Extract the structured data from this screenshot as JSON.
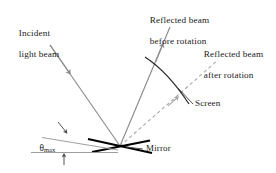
{
  "figure": {
    "type": "optics-ray-diagram",
    "background": "#ffffff",
    "colors": {
      "ray": "#8c8c8c",
      "mirror": "#000000",
      "arc": "#2b2b2b",
      "baseline": "#9a9a9a",
      "text": "#1a1a1a",
      "dashed_ray": "#a0a0a0"
    }
  },
  "labels": {
    "incident_line1": "Incident",
    "incident_line2": "light beam",
    "reflected_before_line1": "Reflected beam",
    "reflected_before_line2": "before rotation",
    "reflected_after_line1": "Reflected beam",
    "reflected_after_line2": "after rotation",
    "screen": "Screen",
    "mirror": "Mirror",
    "theta_symbol": "θ",
    "theta_subscript": "max"
  },
  "geometry": {
    "pivot": {
      "x": 120,
      "y": 146
    },
    "incident_beam": {
      "from": {
        "x": 50,
        "y": 45
      },
      "to": {
        "x": 120,
        "y": 146
      }
    },
    "reflected_before": {
      "from": {
        "x": 120,
        "y": 146
      },
      "to": {
        "x": 170,
        "y": 27
      }
    },
    "reflected_after": {
      "from": {
        "x": 120,
        "y": 146
      },
      "to": {
        "x": 218,
        "y": 60
      }
    },
    "mirror_line_a": {
      "from": {
        "x": 88,
        "y": 138
      },
      "to": {
        "x": 152,
        "y": 152
      }
    },
    "mirror_line_b": {
      "from": {
        "x": 92,
        "y": 151
      },
      "to": {
        "x": 150,
        "y": 140
      }
    },
    "screen_arc": {
      "start": {
        "x": 145,
        "y": 58
      },
      "end": {
        "x": 190,
        "y": 104
      }
    },
    "theta_baseline": {
      "from": {
        "x": 32,
        "y": 152
      },
      "to": {
        "x": 118,
        "y": 152
      }
    },
    "theta_angled": {
      "from": {
        "x": 42,
        "y": 138
      },
      "to": {
        "x": 118,
        "y": 150
      }
    }
  }
}
